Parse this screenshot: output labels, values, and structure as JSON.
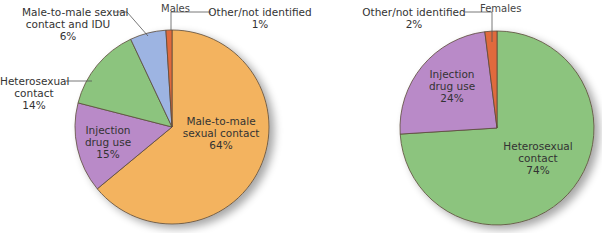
{
  "chart_data": [
    {
      "type": "pie",
      "title": "Males",
      "start_angle_deg": 0,
      "direction": "clockwise",
      "slices": [
        {
          "label": "Male-to-male sexual contact",
          "value": 64,
          "color": "#f3b35e"
        },
        {
          "label": "Injection drug use",
          "value": 15,
          "color": "#b98ac8"
        },
        {
          "label": "Heterosexual contact",
          "value": 14,
          "color": "#8cc47e"
        },
        {
          "label": "Male-to-male sexual contact and IDU",
          "value": 6,
          "color": "#9db4e2"
        },
        {
          "label": "Other/not identified",
          "value": 1,
          "color": "#e06a3c"
        }
      ]
    },
    {
      "type": "pie",
      "title": "Females",
      "start_angle_deg": 0,
      "direction": "clockwise",
      "slices": [
        {
          "label": "Heterosexual contact",
          "value": 74,
          "color": "#8cc47e"
        },
        {
          "label": "Injection drug use",
          "value": 24,
          "color": "#b98ac8"
        },
        {
          "label": "Other/not identified",
          "value": 2,
          "color": "#e06a3c"
        }
      ]
    }
  ],
  "males": {
    "title": "Males",
    "labels": {
      "msm_idu": {
        "line1": "Male-to-male sexual",
        "line2": "contact and IDU",
        "pct": "6%"
      },
      "other": {
        "line1": "Other/not identified",
        "pct": "1%"
      },
      "hetero": {
        "line1": "Heterosexual",
        "line2": "contact",
        "pct": "14%"
      },
      "idu": {
        "line1": "Injection",
        "line2": "drug use",
        "pct": "15%"
      },
      "msm": {
        "line1": "Male-to-male",
        "line2": "sexual contact",
        "pct": "64%"
      }
    }
  },
  "females": {
    "title": "Females",
    "labels": {
      "other": {
        "line1": "Other/not identified",
        "pct": "2%"
      },
      "idu": {
        "line1": "Injection",
        "line2": "drug use",
        "pct": "24%"
      },
      "hetero": {
        "line1": "Heterosexual",
        "line2": "contact",
        "pct": "74%"
      }
    }
  }
}
